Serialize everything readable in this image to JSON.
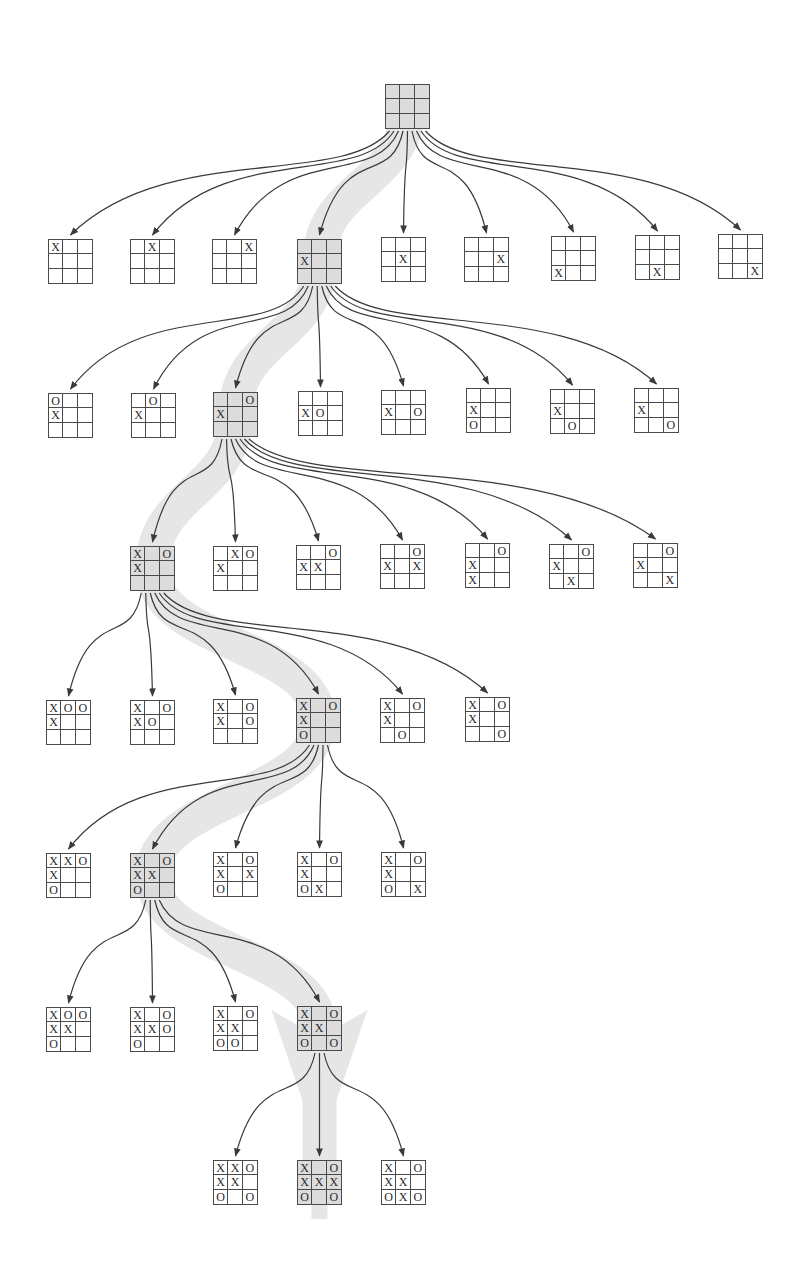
{
  "diagram": {
    "type": "game-tree",
    "game": "tic-tac-toe",
    "board_size": 45,
    "colors": {
      "background": "#ffffff",
      "grid_line": "#4a4a4a",
      "mark": "#2a2a2a",
      "arrow": "#3a3a3a",
      "highlight_band": "#e6e6e6",
      "highlighted_board_fill": "#dcdcdc"
    },
    "marks": {
      "x": "X",
      "o": "O"
    },
    "levels": [
      {
        "depth": 0,
        "boards": [
          {
            "id": "L0-0",
            "x": 385,
            "y": 84,
            "cells": "         ",
            "highlight": true
          }
        ]
      },
      {
        "depth": 1,
        "parent": "L0-0",
        "boards": [
          {
            "id": "L1-0",
            "x": 48,
            "y": 239,
            "cells": "X        "
          },
          {
            "id": "L1-1",
            "x": 130,
            "y": 239,
            "cells": " X       "
          },
          {
            "id": "L1-2",
            "x": 212,
            "y": 239,
            "cells": "  X      "
          },
          {
            "id": "L1-3",
            "x": 297,
            "y": 239,
            "cells": "   X     ",
            "highlight": true
          },
          {
            "id": "L1-4",
            "x": 381,
            "y": 237,
            "cells": "    X    "
          },
          {
            "id": "L1-5",
            "x": 464,
            "y": 237,
            "cells": "     X   "
          },
          {
            "id": "L1-6",
            "x": 551,
            "y": 236,
            "cells": "      X  "
          },
          {
            "id": "L1-7",
            "x": 635,
            "y": 235,
            "cells": "       X "
          },
          {
            "id": "L1-8",
            "x": 718,
            "y": 234,
            "cells": "        X"
          }
        ]
      },
      {
        "depth": 2,
        "parent": "L1-3",
        "boards": [
          {
            "id": "L2-0",
            "x": 48,
            "y": 393,
            "cells": "O  X     "
          },
          {
            "id": "L2-1",
            "x": 131,
            "y": 393,
            "cells": " O X     "
          },
          {
            "id": "L2-2",
            "x": 213,
            "y": 392,
            "cells": "  OX     ",
            "highlight": true
          },
          {
            "id": "L2-3",
            "x": 298,
            "y": 391,
            "cells": "   XO    "
          },
          {
            "id": "L2-4",
            "x": 381,
            "y": 390,
            "cells": "   X O   "
          },
          {
            "id": "L2-5",
            "x": 466,
            "y": 388,
            "cells": "   X  O  "
          },
          {
            "id": "L2-6",
            "x": 550,
            "y": 389,
            "cells": "   X   O "
          },
          {
            "id": "L2-7",
            "x": 634,
            "y": 388,
            "cells": "   X    O"
          }
        ]
      },
      {
        "depth": 3,
        "parent": "L2-2",
        "boards": [
          {
            "id": "L3-0",
            "x": 130,
            "y": 546,
            "cells": "X OX     ",
            "highlight": true
          },
          {
            "id": "L3-1",
            "x": 213,
            "y": 546,
            "cells": " XOX     "
          },
          {
            "id": "L3-2",
            "x": 296,
            "y": 545,
            "cells": "  OXX    "
          },
          {
            "id": "L3-3",
            "x": 380,
            "y": 544,
            "cells": "  OX X   "
          },
          {
            "id": "L3-4",
            "x": 465,
            "y": 543,
            "cells": "  OX  X  "
          },
          {
            "id": "L3-5",
            "x": 549,
            "y": 544,
            "cells": "  OX   X "
          },
          {
            "id": "L3-6",
            "x": 633,
            "y": 543,
            "cells": "  OX    X"
          }
        ]
      },
      {
        "depth": 4,
        "parent": "L3-0",
        "boards": [
          {
            "id": "L4-0",
            "x": 46,
            "y": 700,
            "cells": "XOOX     "
          },
          {
            "id": "L4-1",
            "x": 130,
            "y": 700,
            "cells": "X OXO    "
          },
          {
            "id": "L4-2",
            "x": 213,
            "y": 699,
            "cells": "X OX O   "
          },
          {
            "id": "L4-3",
            "x": 296,
            "y": 698,
            "cells": "X OX  O  ",
            "highlight": true
          },
          {
            "id": "L4-4",
            "x": 380,
            "y": 698,
            "cells": "X OX   O "
          },
          {
            "id": "L4-5",
            "x": 465,
            "y": 697,
            "cells": "X OX    O"
          }
        ]
      },
      {
        "depth": 5,
        "parent": "L4-3",
        "boards": [
          {
            "id": "L5-0",
            "x": 46,
            "y": 853,
            "cells": "XXOX  O  "
          },
          {
            "id": "L5-1",
            "x": 130,
            "y": 853,
            "cells": "X OXX O  ",
            "highlight": true
          },
          {
            "id": "L5-2",
            "x": 213,
            "y": 852,
            "cells": "X OX XO  "
          },
          {
            "id": "L5-3",
            "x": 297,
            "y": 852,
            "cells": "X OX  OX "
          },
          {
            "id": "L5-4",
            "x": 381,
            "y": 852,
            "cells": "X OX  O X"
          }
        ]
      },
      {
        "depth": 6,
        "parent": "L5-1",
        "boards": [
          {
            "id": "L6-0",
            "x": 46,
            "y": 1007,
            "cells": "XOOXX O  "
          },
          {
            "id": "L6-1",
            "x": 130,
            "y": 1007,
            "cells": "X OXXOO  "
          },
          {
            "id": "L6-2",
            "x": 213,
            "y": 1006,
            "cells": "X OXX OO "
          },
          {
            "id": "L6-3",
            "x": 297,
            "y": 1006,
            "cells": "X OXX O O",
            "highlight": true
          }
        ]
      },
      {
        "depth": 7,
        "parent": "L6-3",
        "boards": [
          {
            "id": "L7-0",
            "x": 213,
            "y": 1160,
            "cells": "XXOXX O O"
          },
          {
            "id": "L7-1",
            "x": 297,
            "y": 1160,
            "cells": "X OXXXO O",
            "highlight": true
          },
          {
            "id": "L7-2",
            "x": 381,
            "y": 1160,
            "cells": "X OXX OXO"
          }
        ]
      }
    ]
  }
}
